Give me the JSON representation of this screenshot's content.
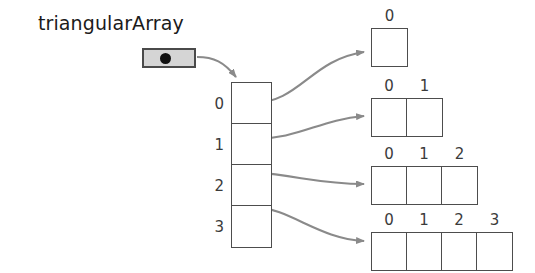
{
  "diagram": {
    "title": "triangularArray",
    "variable_label": "triangularArray",
    "pointer_icon": "filled-dot-reference-icon",
    "colors": {
      "background": "#ffffff",
      "outline": "#4d4d4d",
      "pointer_box_fill": "#d5d5d5",
      "pointer_box_border": "#4a4a4a",
      "pointer_dot": "#111111",
      "arrow": "#8a8a8a",
      "text": "#3b3b3b"
    },
    "outer_array": {
      "name": "outer-array",
      "index_labels": [
        "0",
        "1",
        "2",
        "3"
      ],
      "cell_count": 4
    },
    "rows": [
      {
        "row_index": "0",
        "cell_count": 1,
        "index_labels": [
          "0"
        ]
      },
      {
        "row_index": "1",
        "cell_count": 2,
        "index_labels": [
          "0",
          "1"
        ]
      },
      {
        "row_index": "2",
        "cell_count": 3,
        "index_labels": [
          "0",
          "1",
          "2"
        ]
      },
      {
        "row_index": "3",
        "cell_count": 4,
        "index_labels": [
          "0",
          "1",
          "2",
          "3"
        ]
      }
    ]
  }
}
